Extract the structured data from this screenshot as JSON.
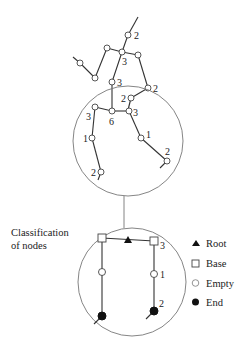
{
  "figure": {
    "caption": {
      "line1": "Classification",
      "line2": "of nodes"
    },
    "legend": [
      {
        "symbol": "filled-triangle",
        "label": "Root"
      },
      {
        "symbol": "open-square",
        "label": "Base"
      },
      {
        "symbol": "open-circle",
        "label": "Empty"
      },
      {
        "symbol": "filled-circle",
        "label": "End"
      }
    ],
    "top_tree_labels": [
      "2",
      "3",
      "3",
      "2"
    ],
    "middle_circle_labels": [
      "2",
      "3",
      "6",
      "3",
      "1",
      "1",
      "2",
      "2"
    ],
    "bottom_circle_labels": [
      "3",
      "1",
      "2"
    ]
  }
}
